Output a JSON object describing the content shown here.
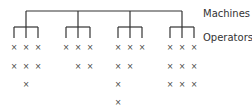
{
  "labels": {
    "machines": "Machines",
    "operators": "Operators"
  },
  "colors": {
    "line": "#333333",
    "mark": "#444444"
  },
  "mark_glyph": "×",
  "tree": {
    "root_y": 11,
    "machine_x": [
      26,
      78,
      130,
      182
    ],
    "bracket_y": 27,
    "leg_bottom_y": 38,
    "operator_offsets": [
      -12,
      0,
      12
    ]
  },
  "groups": [
    {
      "name": "machine-1",
      "counts": [
        2,
        3,
        2
      ]
    },
    {
      "name": "machine-2",
      "counts": [
        1,
        2,
        2
      ]
    },
    {
      "name": "machine-3",
      "counts": [
        4,
        2,
        1
      ]
    },
    {
      "name": "machine-4",
      "counts": [
        3,
        3,
        3
      ]
    }
  ],
  "row_y": [
    48,
    67,
    85,
    103
  ]
}
